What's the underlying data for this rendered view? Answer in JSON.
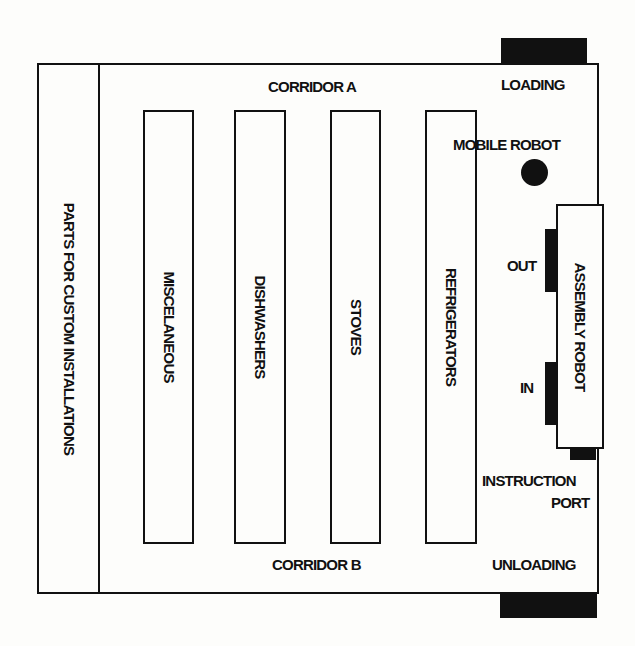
{
  "diagram": {
    "type": "warehouse floor plan",
    "corridors": {
      "top": "CORRIDOR A",
      "bottom": "CORRIDOR B"
    },
    "side_storage": {
      "label": "PARTS FOR CUSTOM INSTALLATIONS"
    },
    "aisles": [
      {
        "label": "MISCELANEOUS"
      },
      {
        "label": "DISHWASHERS"
      },
      {
        "label": "STOVES"
      },
      {
        "label": "REFRIGERATORS"
      }
    ],
    "docks": {
      "loading": "LOADING",
      "unloading": "UNLOADING"
    },
    "mobile_robot": {
      "label": "MOBILE ROBOT"
    },
    "assembly_robot": {
      "label": "ASSEMBLY ROBOT",
      "out_port": "OUT",
      "in_port": "IN",
      "instruction_port_line1": "INSTRUCTION",
      "instruction_port_line2": "PORT"
    },
    "colors": {
      "ink": "#111111",
      "paper": "#fdfdfb"
    }
  }
}
